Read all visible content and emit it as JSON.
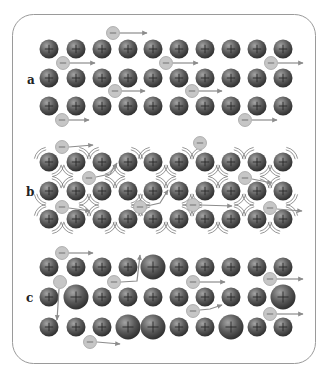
{
  "figure": {
    "width": 330,
    "height": 378,
    "frame": {
      "x": 12.5,
      "y": 14.5,
      "width": 303,
      "height": 349,
      "radius": 21
    },
    "colors": {
      "cation_highlight": "#a4a4a4",
      "cation_mid": "#5a5a5a",
      "cation_edge": "#2e2e2e",
      "electron_fill": "#c6c6c6",
      "arrow": "#8c8c8c",
      "frame": "#9a9a9a"
    },
    "cation_symbol": "+",
    "electron_symbol": "−",
    "column_x": [
      49,
      76,
      102,
      128,
      153,
      179,
      205,
      231,
      257,
      283
    ],
    "cation_radius": 9.5,
    "large_cation_radius": 12.5,
    "electron_radius": 6.5
  },
  "panels": [
    {
      "id": "a",
      "label": "a",
      "label_pos": [
        27,
        84
      ],
      "row_y": [
        49,
        78,
        106
      ],
      "vibrating": false,
      "large_cations": [
        [],
        [],
        []
      ],
      "electrons": [
        {
          "x": 113,
          "y": 33,
          "sign": true,
          "path": [
            [
              120,
              33
            ],
            [
              147,
              33
            ]
          ]
        },
        {
          "x": 63,
          "y": 63,
          "sign": true,
          "path": [
            [
              70,
              63
            ],
            [
              95,
              63
            ]
          ]
        },
        {
          "x": 166,
          "y": 63,
          "sign": true,
          "path": [
            [
              173,
              63
            ],
            [
              198,
              63
            ]
          ]
        },
        {
          "x": 271,
          "y": 63,
          "sign": true,
          "path": [
            [
              278,
              63
            ],
            [
              303,
              63
            ]
          ]
        },
        {
          "x": 115,
          "y": 91,
          "sign": true,
          "path": [
            [
              122,
              91
            ],
            [
              145,
              91
            ]
          ]
        },
        {
          "x": 192,
          "y": 91,
          "sign": true,
          "path": [
            [
              199,
              91
            ],
            [
              222,
              91
            ]
          ]
        },
        {
          "x": 62,
          "y": 120,
          "sign": true,
          "path": [
            [
              69,
              120
            ],
            [
              89,
              120
            ]
          ]
        },
        {
          "x": 245,
          "y": 120,
          "sign": true,
          "path": [
            [
              252,
              120
            ],
            [
              277,
              120
            ]
          ]
        }
      ]
    },
    {
      "id": "b",
      "label": "b",
      "label_pos": [
        26,
        196
      ],
      "row_y": [
        162,
        191,
        219
      ],
      "vibrating": true,
      "vibration_pattern": [
        "1212121212",
        "2121212121",
        "1212121212"
      ],
      "large_cations": [
        [],
        [],
        []
      ],
      "electrons": [
        {
          "x": 62,
          "y": 147,
          "sign": true,
          "path": [
            [
              69,
              147
            ],
            [
              93,
              145
            ]
          ]
        },
        {
          "x": 200,
          "y": 143,
          "sign": true,
          "path": []
        },
        {
          "x": 89,
          "y": 178,
          "sign": true,
          "path": [
            [
              96,
              177
            ],
            [
              110,
              174
            ],
            [
              117,
              163
            ]
          ]
        },
        {
          "x": 245,
          "y": 178,
          "sign": true,
          "path": [
            [
              252,
              179
            ],
            [
              272,
              183
            ]
          ]
        },
        {
          "x": 62,
          "y": 207,
          "sign": true,
          "path": [
            [
              69,
              208
            ],
            [
              90,
              211
            ]
          ]
        },
        {
          "x": 140,
          "y": 207,
          "sign": true,
          "path": [
            [
              147,
              206
            ],
            [
              160,
              203
            ],
            [
              168,
              190
            ]
          ]
        },
        {
          "x": 193,
          "y": 205,
          "sign": true,
          "path": [
            [
              200,
              205
            ],
            [
              232,
              206
            ]
          ]
        },
        {
          "x": 270,
          "y": 208,
          "sign": true,
          "path": [
            [
              277,
              209
            ],
            [
              302,
              211
            ]
          ]
        }
      ]
    },
    {
      "id": "c",
      "label": "c",
      "label_pos": [
        26,
        302
      ],
      "row_y": [
        267,
        297,
        327
      ],
      "vibrating": false,
      "large_cations": [
        [
          4
        ],
        [
          1,
          9
        ],
        [
          3,
          4,
          7
        ]
      ],
      "electrons": [
        {
          "x": 62,
          "y": 253,
          "sign": true,
          "path": [
            [
              69,
              253
            ],
            [
              93,
              253
            ]
          ]
        },
        {
          "x": 60,
          "y": 282,
          "sign": false,
          "path": [
            [
              59,
              289
            ],
            [
              57,
              320
            ]
          ]
        },
        {
          "x": 114,
          "y": 282,
          "sign": true,
          "path": [
            [
              121,
              282
            ],
            [
              137,
              281
            ],
            [
              140,
              255
            ]
          ]
        },
        {
          "x": 193,
          "y": 282,
          "sign": true,
          "path": [
            [
              200,
              282
            ],
            [
              225,
              282
            ]
          ]
        },
        {
          "x": 270,
          "y": 279,
          "sign": true,
          "path": [
            [
              277,
              279
            ],
            [
              303,
              279
            ]
          ]
        },
        {
          "x": 193,
          "y": 311,
          "sign": true,
          "path": [
            [
              200,
              310
            ],
            [
              210,
              309
            ],
            [
              222,
              305
            ]
          ]
        },
        {
          "x": 270,
          "y": 314,
          "sign": true,
          "path": [
            [
              277,
              314
            ],
            [
              303,
              314
            ]
          ]
        },
        {
          "x": 90,
          "y": 342,
          "sign": true,
          "path": [
            [
              97,
              342
            ],
            [
              120,
              344
            ]
          ]
        }
      ]
    }
  ]
}
